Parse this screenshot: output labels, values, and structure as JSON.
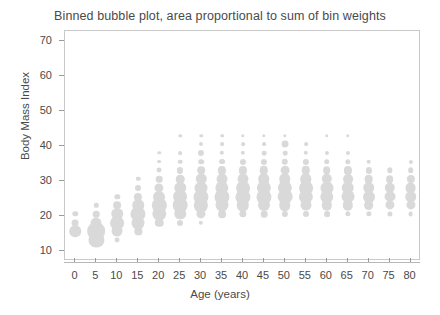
{
  "chart": {
    "title": "Binned bubble plot, area proportional to sum of bin weights",
    "xlabel": "Age (years)",
    "ylabel": "Body Mass Index"
  },
  "chart_data": {
    "type": "scatter",
    "title": "Binned bubble plot, area proportional to sum of bin weights",
    "xlabel": "Age (years)",
    "ylabel": "Body Mass Index",
    "xlim": [
      -2.5,
      82.5
    ],
    "ylim": [
      7.0,
      73.0
    ],
    "xticks": [
      0,
      5,
      10,
      15,
      20,
      25,
      30,
      35,
      40,
      45,
      50,
      55,
      60,
      65,
      70,
      75,
      80
    ],
    "yticks": [
      10,
      20,
      30,
      40,
      50,
      60,
      70
    ],
    "grid": false,
    "legend": null,
    "marker_color": "#d9d9d9",
    "size_encoding": "area proportional to sum of bin weights",
    "points": [
      {
        "x": 0,
        "y": 15.5,
        "w": 5.5
      },
      {
        "x": 0,
        "y": 18.0,
        "w": 2.0
      },
      {
        "x": 0,
        "y": 20.5,
        "w": 1.2
      },
      {
        "x": 5,
        "y": 13.0,
        "w": 9.5
      },
      {
        "x": 5,
        "y": 15.5,
        "w": 13.0
      },
      {
        "x": 5,
        "y": 18.0,
        "w": 5.0
      },
      {
        "x": 5,
        "y": 20.5,
        "w": 1.8
      },
      {
        "x": 5,
        "y": 23.0,
        "w": 0.8
      },
      {
        "x": 10,
        "y": 15.5,
        "w": 5.0
      },
      {
        "x": 10,
        "y": 18.0,
        "w": 8.0
      },
      {
        "x": 10,
        "y": 20.5,
        "w": 5.5
      },
      {
        "x": 10,
        "y": 23.0,
        "w": 2.5
      },
      {
        "x": 10,
        "y": 25.5,
        "w": 1.2
      },
      {
        "x": 10,
        "y": 13.0,
        "w": 1.0
      },
      {
        "x": 15,
        "y": 15.5,
        "w": 2.2
      },
      {
        "x": 15,
        "y": 18.0,
        "w": 7.0
      },
      {
        "x": 15,
        "y": 20.5,
        "w": 9.5
      },
      {
        "x": 15,
        "y": 23.0,
        "w": 5.5
      },
      {
        "x": 15,
        "y": 25.5,
        "w": 2.8
      },
      {
        "x": 15,
        "y": 28.0,
        "w": 1.5
      },
      {
        "x": 15,
        "y": 30.5,
        "w": 0.8
      },
      {
        "x": 20,
        "y": 18.0,
        "w": 3.0
      },
      {
        "x": 20,
        "y": 20.5,
        "w": 7.5
      },
      {
        "x": 20,
        "y": 23.0,
        "w": 8.5
      },
      {
        "x": 20,
        "y": 25.5,
        "w": 6.0
      },
      {
        "x": 20,
        "y": 28.0,
        "w": 3.5
      },
      {
        "x": 20,
        "y": 30.5,
        "w": 1.8
      },
      {
        "x": 20,
        "y": 33.0,
        "w": 1.0
      },
      {
        "x": 20,
        "y": 35.5,
        "w": 0.6
      },
      {
        "x": 20,
        "y": 38.0,
        "w": 0.5
      },
      {
        "x": 25,
        "y": 18.0,
        "w": 1.5
      },
      {
        "x": 25,
        "y": 20.5,
        "w": 5.5
      },
      {
        "x": 25,
        "y": 23.0,
        "w": 9.0
      },
      {
        "x": 25,
        "y": 25.5,
        "w": 8.0
      },
      {
        "x": 25,
        "y": 28.0,
        "w": 5.5
      },
      {
        "x": 25,
        "y": 30.5,
        "w": 3.0
      },
      {
        "x": 25,
        "y": 33.0,
        "w": 1.6
      },
      {
        "x": 25,
        "y": 35.5,
        "w": 0.9
      },
      {
        "x": 25,
        "y": 38.0,
        "w": 0.6
      },
      {
        "x": 25,
        "y": 43.0,
        "w": 0.5
      },
      {
        "x": 30,
        "y": 20.5,
        "w": 3.5
      },
      {
        "x": 30,
        "y": 23.0,
        "w": 8.5
      },
      {
        "x": 30,
        "y": 25.5,
        "w": 9.5
      },
      {
        "x": 30,
        "y": 28.0,
        "w": 7.0
      },
      {
        "x": 30,
        "y": 30.5,
        "w": 4.5
      },
      {
        "x": 30,
        "y": 33.0,
        "w": 2.4
      },
      {
        "x": 30,
        "y": 35.5,
        "w": 1.3
      },
      {
        "x": 30,
        "y": 38.0,
        "w": 1.6
      },
      {
        "x": 30,
        "y": 40.5,
        "w": 0.7
      },
      {
        "x": 30,
        "y": 43.0,
        "w": 0.5
      },
      {
        "x": 30,
        "y": 18.0,
        "w": 0.8
      },
      {
        "x": 35,
        "y": 20.5,
        "w": 2.5
      },
      {
        "x": 35,
        "y": 23.0,
        "w": 7.0
      },
      {
        "x": 35,
        "y": 25.5,
        "w": 9.5
      },
      {
        "x": 35,
        "y": 28.0,
        "w": 7.5
      },
      {
        "x": 35,
        "y": 30.5,
        "w": 5.0
      },
      {
        "x": 35,
        "y": 33.0,
        "w": 2.8
      },
      {
        "x": 35,
        "y": 35.5,
        "w": 1.4
      },
      {
        "x": 35,
        "y": 38.0,
        "w": 0.8
      },
      {
        "x": 35,
        "y": 40.5,
        "w": 0.6
      },
      {
        "x": 35,
        "y": 43.0,
        "w": 0.5
      },
      {
        "x": 40,
        "y": 20.5,
        "w": 2.2
      },
      {
        "x": 40,
        "y": 23.0,
        "w": 6.5
      },
      {
        "x": 40,
        "y": 25.5,
        "w": 9.5
      },
      {
        "x": 40,
        "y": 28.0,
        "w": 8.0
      },
      {
        "x": 40,
        "y": 30.5,
        "w": 5.0
      },
      {
        "x": 40,
        "y": 33.0,
        "w": 2.8
      },
      {
        "x": 40,
        "y": 35.5,
        "w": 1.5
      },
      {
        "x": 40,
        "y": 38.0,
        "w": 0.8
      },
      {
        "x": 40,
        "y": 40.5,
        "w": 0.6
      },
      {
        "x": 40,
        "y": 43.0,
        "w": 0.5
      },
      {
        "x": 45,
        "y": 20.5,
        "w": 1.8
      },
      {
        "x": 45,
        "y": 23.0,
        "w": 6.0
      },
      {
        "x": 45,
        "y": 25.5,
        "w": 9.5
      },
      {
        "x": 45,
        "y": 28.0,
        "w": 8.5
      },
      {
        "x": 45,
        "y": 30.5,
        "w": 5.5
      },
      {
        "x": 45,
        "y": 33.0,
        "w": 3.0
      },
      {
        "x": 45,
        "y": 35.5,
        "w": 1.6
      },
      {
        "x": 45,
        "y": 38.0,
        "w": 0.9
      },
      {
        "x": 45,
        "y": 40.5,
        "w": 0.6
      },
      {
        "x": 45,
        "y": 43.0,
        "w": 0.5
      },
      {
        "x": 50,
        "y": 20.5,
        "w": 1.6
      },
      {
        "x": 50,
        "y": 23.0,
        "w": 5.5
      },
      {
        "x": 50,
        "y": 25.5,
        "w": 9.0
      },
      {
        "x": 50,
        "y": 28.0,
        "w": 8.5
      },
      {
        "x": 50,
        "y": 30.5,
        "w": 5.5
      },
      {
        "x": 50,
        "y": 33.0,
        "w": 3.2
      },
      {
        "x": 50,
        "y": 35.5,
        "w": 1.7
      },
      {
        "x": 50,
        "y": 38.0,
        "w": 0.9
      },
      {
        "x": 50,
        "y": 40.5,
        "w": 2.0
      },
      {
        "x": 50,
        "y": 43.0,
        "w": 0.5
      },
      {
        "x": 55,
        "y": 20.5,
        "w": 1.5
      },
      {
        "x": 55,
        "y": 23.0,
        "w": 5.0
      },
      {
        "x": 55,
        "y": 25.5,
        "w": 8.5
      },
      {
        "x": 55,
        "y": 28.0,
        "w": 8.0
      },
      {
        "x": 55,
        "y": 30.5,
        "w": 5.5
      },
      {
        "x": 55,
        "y": 33.0,
        "w": 3.0
      },
      {
        "x": 55,
        "y": 35.5,
        "w": 1.6
      },
      {
        "x": 55,
        "y": 38.0,
        "w": 0.8
      },
      {
        "x": 55,
        "y": 40.5,
        "w": 0.6
      },
      {
        "x": 60,
        "y": 20.5,
        "w": 1.4
      },
      {
        "x": 60,
        "y": 23.0,
        "w": 4.5
      },
      {
        "x": 60,
        "y": 25.5,
        "w": 7.5
      },
      {
        "x": 60,
        "y": 28.0,
        "w": 7.0
      },
      {
        "x": 60,
        "y": 30.5,
        "w": 4.5
      },
      {
        "x": 60,
        "y": 33.0,
        "w": 2.5
      },
      {
        "x": 60,
        "y": 35.5,
        "w": 1.3
      },
      {
        "x": 60,
        "y": 38.0,
        "w": 0.7
      },
      {
        "x": 60,
        "y": 43.0,
        "w": 0.5
      },
      {
        "x": 65,
        "y": 20.5,
        "w": 1.2
      },
      {
        "x": 65,
        "y": 23.0,
        "w": 4.5
      },
      {
        "x": 65,
        "y": 25.5,
        "w": 7.0
      },
      {
        "x": 65,
        "y": 28.0,
        "w": 6.5
      },
      {
        "x": 65,
        "y": 30.5,
        "w": 4.0
      },
      {
        "x": 65,
        "y": 33.0,
        "w": 2.8
      },
      {
        "x": 65,
        "y": 35.5,
        "w": 1.2
      },
      {
        "x": 65,
        "y": 38.0,
        "w": 0.7
      },
      {
        "x": 65,
        "y": 43.0,
        "w": 0.5
      },
      {
        "x": 70,
        "y": 20.5,
        "w": 1.2
      },
      {
        "x": 70,
        "y": 23.0,
        "w": 4.0
      },
      {
        "x": 70,
        "y": 25.5,
        "w": 6.0
      },
      {
        "x": 70,
        "y": 28.0,
        "w": 5.5
      },
      {
        "x": 70,
        "y": 30.5,
        "w": 3.2
      },
      {
        "x": 70,
        "y": 33.0,
        "w": 1.6
      },
      {
        "x": 70,
        "y": 35.5,
        "w": 0.9
      },
      {
        "x": 75,
        "y": 20.5,
        "w": 1.1
      },
      {
        "x": 75,
        "y": 23.0,
        "w": 3.5
      },
      {
        "x": 75,
        "y": 25.5,
        "w": 5.0
      },
      {
        "x": 75,
        "y": 28.0,
        "w": 4.5
      },
      {
        "x": 75,
        "y": 30.5,
        "w": 2.5
      },
      {
        "x": 75,
        "y": 33.0,
        "w": 1.2
      },
      {
        "x": 80,
        "y": 20.5,
        "w": 1.0
      },
      {
        "x": 80,
        "y": 23.0,
        "w": 3.5
      },
      {
        "x": 80,
        "y": 25.5,
        "w": 5.5
      },
      {
        "x": 80,
        "y": 28.0,
        "w": 5.0
      },
      {
        "x": 80,
        "y": 30.5,
        "w": 2.8
      },
      {
        "x": 80,
        "y": 33.0,
        "w": 1.3
      },
      {
        "x": 80,
        "y": 35.5,
        "w": 0.7
      }
    ]
  },
  "axes": {
    "x_ticks": [
      "0",
      "5",
      "10",
      "15",
      "20",
      "25",
      "30",
      "35",
      "40",
      "45",
      "50",
      "55",
      "60",
      "65",
      "70",
      "75",
      "80"
    ],
    "y_ticks": [
      "10",
      "20",
      "30",
      "40",
      "50",
      "60",
      "70"
    ]
  }
}
